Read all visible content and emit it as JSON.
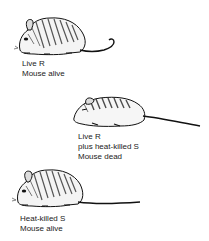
{
  "figure": {
    "panels": [
      {
        "id": "live-r",
        "icon": "mouse-icon",
        "state": "alive",
        "caption": [
          "Live R",
          "Mouse alive"
        ]
      },
      {
        "id": "live-r-plus-heat-killed-s",
        "icon": "mouse-icon",
        "state": "dead",
        "caption": [
          "Live R",
          "plus heat-killed S",
          "Mouse dead"
        ]
      },
      {
        "id": "heat-killed-s",
        "icon": "mouse-icon",
        "state": "alive",
        "caption": [
          "Heat-killed S",
          "Mouse alive"
        ]
      }
    ]
  }
}
